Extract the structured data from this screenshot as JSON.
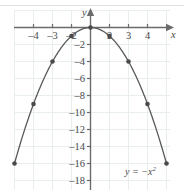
{
  "figure": {
    "title": "",
    "equation_label": "y = −x",
    "equation_exponent": "2",
    "x_axis_name": "x",
    "y_axis_name": "y",
    "colors": {
      "curve": "#595959",
      "axis": "#6b6b6b",
      "grid": "#e8eef0",
      "point": "#4a4a4a",
      "text": "#4a4a4a",
      "background": "#ffffff"
    }
  },
  "chart_data": {
    "type": "line",
    "title": "",
    "xlabel": "x",
    "ylabel": "y",
    "equation": "y = -x^2",
    "grid": true,
    "legend": "none",
    "xlim": [
      -5,
      5
    ],
    "ylim": [
      -19,
      1
    ],
    "xticks": [
      -4,
      -3,
      -2,
      2,
      3,
      4
    ],
    "xtick_labels": [
      "–4",
      "–3",
      "–2",
      "2",
      "3",
      "4"
    ],
    "yticks": [
      -2,
      -4,
      -6,
      -8,
      -10,
      -12,
      -14,
      -16,
      -18
    ],
    "ytick_labels": [
      "–2",
      "–4",
      "–6",
      "–8",
      "–10",
      "–12",
      "–14",
      "–16",
      "–18"
    ],
    "x": [
      -4,
      -3,
      -2,
      -1,
      0,
      1,
      2,
      3,
      4
    ],
    "values": [
      -16,
      -9,
      -4,
      -1,
      0,
      -1,
      -4,
      -9,
      -16
    ],
    "series": [
      {
        "name": "y = -x^2",
        "x": [
          -4,
          -3,
          -2,
          -1,
          0,
          1,
          2,
          3,
          4
        ],
        "values": [
          -16,
          -9,
          -4,
          -1,
          0,
          -1,
          -4,
          -9,
          -16
        ]
      }
    ],
    "annotations": [
      {
        "text": "y = −x²",
        "x": 3.1,
        "y": -17.6
      }
    ]
  }
}
